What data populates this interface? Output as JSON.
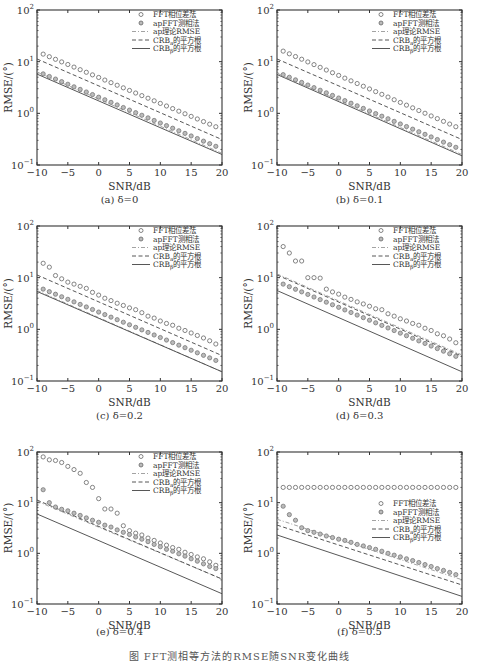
{
  "figure_caption": "图    FFT测相等方法的RMSE随SNR变化曲线",
  "chart_data": [
    {
      "id": "a",
      "type": "scatter",
      "caption": "(a) δ=0",
      "xlabel": "SNR/dB",
      "ylabel": "RMSE/(°)",
      "xlim": [
        -10,
        20
      ],
      "ylim": [
        0.1,
        100
      ],
      "yscale": "log",
      "xticks": [
        -10,
        -5,
        0,
        5,
        10,
        15,
        20
      ],
      "yticks": [
        "10^-1",
        "10^0",
        "10^1",
        "10^2"
      ],
      "legend_position": "upper right",
      "x": [
        -9,
        -8,
        -7,
        -6,
        -5,
        -4,
        -3,
        -2,
        -1,
        0,
        1,
        2,
        3,
        4,
        5,
        6,
        7,
        8,
        9,
        10,
        11,
        12,
        13,
        14,
        15,
        16,
        17,
        18,
        19
      ],
      "series": [
        {
          "name": "FFT相位差法",
          "style": "circle",
          "start": 14.0,
          "end": 0.55
        },
        {
          "name": "apFFT测相法",
          "style": "dot-circle",
          "start": 5.8,
          "end": 0.23
        },
        {
          "name": "ap理论RMSE",
          "style": "dashdot",
          "start": 5.6,
          "end": 0.19
        },
        {
          "name": "CRB_a的平方根",
          "style": "dashed",
          "start": 10.0,
          "end": 0.35
        },
        {
          "name": "CRB_β的平方根",
          "style": "solid",
          "start": 5.1,
          "end": 0.18
        }
      ]
    },
    {
      "id": "b",
      "type": "scatter",
      "caption": "(b) δ=0.1",
      "xlabel": "SNR/dB",
      "ylabel": "RMSE/(°)",
      "xlim": [
        -10,
        20
      ],
      "ylim": [
        0.1,
        100
      ],
      "yscale": "log",
      "xticks": [
        -10,
        -5,
        0,
        5,
        10,
        15,
        20
      ],
      "yticks": [
        "10^-1",
        "10^0",
        "10^1",
        "10^2"
      ],
      "legend_position": "upper right",
      "x": [
        -9,
        -8,
        -7,
        -6,
        -5,
        -4,
        -3,
        -2,
        -1,
        0,
        1,
        2,
        3,
        4,
        5,
        6,
        7,
        8,
        9,
        10,
        11,
        12,
        13,
        14,
        15,
        16,
        17,
        18,
        19
      ],
      "series": [
        {
          "name": "FFT相位差法",
          "style": "circle",
          "start": 16.0,
          "end": 0.55
        },
        {
          "name": "apFFT测相法",
          "style": "dot-circle",
          "start": 5.6,
          "end": 0.22
        },
        {
          "name": "ap理论RMSE",
          "style": "dashdot",
          "start": 5.3,
          "end": 0.18
        },
        {
          "name": "CRB_a的平方根",
          "style": "dashed",
          "start": 10.0,
          "end": 0.35
        },
        {
          "name": "CRB_β的平方根",
          "style": "solid",
          "start": 5.0,
          "end": 0.17
        }
      ]
    },
    {
      "id": "c",
      "type": "scatter",
      "caption": "(c) δ=0.2",
      "xlabel": "SNR/dB",
      "ylabel": "RMSE/(°)",
      "xlim": [
        -10,
        20
      ],
      "ylim": [
        0.1,
        100
      ],
      "yscale": "log",
      "xticks": [
        -10,
        -5,
        0,
        5,
        10,
        15,
        20
      ],
      "yticks": [
        "10^-1",
        "10^0",
        "10^1",
        "10^2"
      ],
      "legend_position": "upper right",
      "x": [
        -9,
        -8,
        -7,
        -6,
        -5,
        -4,
        -3,
        -2,
        -1,
        0,
        1,
        2,
        3,
        4,
        5,
        6,
        7,
        8,
        9,
        10,
        11,
        12,
        13,
        14,
        15,
        16,
        17,
        18,
        19
      ],
      "series": [
        {
          "name": "FFT相位差法",
          "style": "circle",
          "values": [
            19,
            16,
            11,
            9.5,
            8.2,
            7.5,
            6.8,
            6.2,
            5.2,
            4.6,
            4.0,
            3.6,
            3.2,
            2.9,
            2.6,
            2.4,
            2.1,
            1.8,
            1.65,
            1.45,
            1.3,
            1.2,
            1.05,
            0.95,
            0.85,
            0.76,
            0.68,
            0.6,
            0.52
          ]
        },
        {
          "name": "apFFT测相法",
          "style": "dot-circle",
          "start": 6.0,
          "end": 0.25
        },
        {
          "name": "ap理论RMSE",
          "style": "dashdot",
          "start": 5.0,
          "end": 0.17
        },
        {
          "name": "CRB_a的平方根",
          "style": "dashed",
          "start": 10.0,
          "end": 0.35
        },
        {
          "name": "CRB_β的平方根",
          "style": "solid",
          "start": 4.8,
          "end": 0.17
        }
      ]
    },
    {
      "id": "d",
      "type": "scatter",
      "caption": "(d) δ=0.3",
      "xlabel": "SNR/dB",
      "ylabel": "RMSE/(°)",
      "xlim": [
        -10,
        20
      ],
      "ylim": [
        0.1,
        100
      ],
      "yscale": "log",
      "xticks": [
        -10,
        -5,
        0,
        5,
        10,
        15,
        20
      ],
      "yticks": [
        "10^-1",
        "10^0",
        "10^1",
        "10^2"
      ],
      "legend_position": "upper right",
      "x": [
        -9,
        -8,
        -7,
        -6,
        -5,
        -4,
        -3,
        -2,
        -1,
        0,
        1,
        2,
        3,
        4,
        5,
        6,
        7,
        8,
        9,
        10,
        11,
        12,
        13,
        14,
        15,
        16,
        17,
        18,
        19
      ],
      "series": [
        {
          "name": "FFT相位差法",
          "style": "circle",
          "values": [
            40,
            30,
            21,
            21,
            10,
            10,
            9.8,
            6.0,
            5.3,
            4.8,
            4.2,
            3.8,
            3.4,
            3.1,
            2.8,
            2.5,
            2.4,
            2.0,
            1.8,
            1.6,
            1.45,
            1.3,
            1.2,
            1.05,
            0.95,
            0.82,
            0.75,
            0.65,
            0.55
          ]
        },
        {
          "name": "apFFT测相法",
          "style": "dot-circle",
          "start": 7.5,
          "end": 0.3
        },
        {
          "name": "ap理论RMSE",
          "style": "dashdot",
          "start": 10.5,
          "end": 0.36
        },
        {
          "name": "CRB_a的平方根",
          "style": "dashed",
          "start": 10.0,
          "end": 0.34
        },
        {
          "name": "CRB_β的平方根",
          "style": "solid",
          "start": 5.0,
          "end": 0.17
        }
      ]
    },
    {
      "id": "e",
      "type": "scatter",
      "caption": "(e) δ=0.4",
      "xlabel": "SNR/dB",
      "ylabel": "RMSE/(°)",
      "xlim": [
        -10,
        20
      ],
      "ylim": [
        0.1,
        100
      ],
      "yscale": "log",
      "xticks": [
        -10,
        -5,
        0,
        5,
        10,
        15,
        20
      ],
      "yticks": [
        "10^-1",
        "10^0",
        "10^1",
        "10^2"
      ],
      "legend_position": "upper right",
      "x": [
        -9,
        -8,
        -7,
        -6,
        -5,
        -4,
        -3,
        -2,
        -1,
        0,
        1,
        2,
        3,
        4,
        5,
        6,
        7,
        8,
        9,
        10,
        11,
        12,
        13,
        14,
        15,
        16,
        17,
        18,
        19
      ],
      "series": [
        {
          "name": "FFT相位差法",
          "style": "circle",
          "values": [
            80,
            70,
            68,
            62,
            52,
            45,
            38,
            25,
            20,
            12,
            7.5,
            7.5,
            6.2,
            3.5,
            2.8,
            2.5,
            2.3,
            2.0,
            1.8,
            1.6,
            1.45,
            1.3,
            1.2,
            1.05,
            0.95,
            0.85,
            0.78,
            0.68,
            0.58
          ]
        },
        {
          "name": "apFFT测相法",
          "style": "dot-circle",
          "values": [
            18,
            10,
            8.2,
            7.4,
            6.9,
            6.2,
            5.6,
            5.0,
            4.5,
            4.1,
            3.6,
            3.3,
            2.9,
            2.6,
            2.35,
            2.1,
            1.9,
            1.7,
            1.5,
            1.35,
            1.2,
            1.1,
            0.98,
            0.88,
            0.78,
            0.7,
            0.62,
            0.55,
            0.5
          ]
        },
        {
          "name": "ap理论RMSE",
          "style": "dashdot",
          "start": 9.5,
          "end": 0.35
        },
        {
          "name": "CRB_a的平方根",
          "style": "dashed",
          "start": 10.0,
          "end": 0.35
        },
        {
          "name": "CRB_β的平方根",
          "style": "solid",
          "start": 5.3,
          "end": 0.18
        }
      ]
    },
    {
      "id": "f",
      "type": "scatter",
      "caption": "(f) δ=0.5",
      "xlabel": "SNR/dB",
      "ylabel": "RMSE/(°)",
      "xlim": [
        -10,
        20
      ],
      "ylim": [
        0.1,
        100
      ],
      "yscale": "log",
      "xticks": [
        -10,
        -5,
        0,
        5,
        10,
        15,
        20
      ],
      "yticks": [
        "10^-1",
        "10^0",
        "10^1",
        "10^2"
      ],
      "legend_position": "center right",
      "x": [
        -9,
        -8,
        -7,
        -6,
        -5,
        -4,
        -3,
        -2,
        -1,
        0,
        1,
        2,
        3,
        4,
        5,
        6,
        7,
        8,
        9,
        10,
        11,
        12,
        13,
        14,
        15,
        16,
        17,
        18,
        19
      ],
      "series": [
        {
          "name": "FFT相位差法",
          "style": "circle",
          "values": [
            20,
            20,
            20,
            20,
            20,
            20,
            20,
            20,
            20,
            20,
            20,
            20,
            20,
            20,
            20,
            20,
            20,
            20,
            20,
            20,
            20,
            20,
            20,
            20,
            20,
            20,
            20,
            20,
            20
          ]
        },
        {
          "name": "apFFT测相法",
          "style": "dot-circle",
          "values": [
            8.5,
            5.8,
            4.5,
            3.2,
            2.8,
            2.6,
            2.4,
            2.2,
            2.05,
            1.9,
            1.8,
            1.65,
            1.5,
            1.4,
            1.3,
            1.2,
            1.1,
            1.0,
            0.92,
            0.85,
            0.78,
            0.72,
            0.66,
            0.6,
            0.55,
            0.5,
            0.46,
            0.42,
            0.38
          ]
        },
        {
          "name": "ap理论RMSE",
          "style": "dashdot",
          "start": 4.3,
          "end": 0.33
        },
        {
          "name": "CRB_a的平方根",
          "style": "dashed",
          "start": 3.3,
          "end": 0.26
        },
        {
          "name": "CRB_β的平方根",
          "style": "solid",
          "start": 2.1,
          "end": 0.155
        }
      ]
    }
  ],
  "panels_layout": [
    {
      "left": 0,
      "top": 0
    },
    {
      "left": 240,
      "top": 0
    },
    {
      "left": 0,
      "top": 216
    },
    {
      "left": 240,
      "top": 216
    },
    {
      "left": 0,
      "top": 442
    },
    {
      "left": 240,
      "top": 442
    }
  ]
}
